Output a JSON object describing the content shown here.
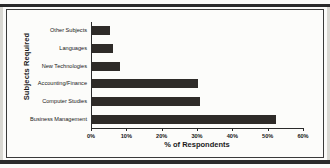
{
  "chart_data": {
    "type": "bar",
    "orientation": "horizontal",
    "title": "",
    "xlabel": "% of Respondents",
    "ylabel": "Subjects Required",
    "categories": [
      "Other Subjects",
      "Languages",
      "New Technologies",
      "Accounting/Finance",
      "Computer Studies",
      "Business Management"
    ],
    "values": [
      5,
      6,
      8,
      30,
      30.5,
      52
    ],
    "xlim": [
      0,
      60
    ],
    "xticks": [
      0,
      10,
      20,
      30,
      40,
      50,
      60
    ],
    "xtick_labels": [
      "0%",
      "10%",
      "20%",
      "30%",
      "40%",
      "50%",
      "60%"
    ],
    "grid": false,
    "legend": null,
    "bar_color": "#2e2b28",
    "plot_background": "#fcfcfa",
    "axis_color": "#2a2a2a"
  }
}
